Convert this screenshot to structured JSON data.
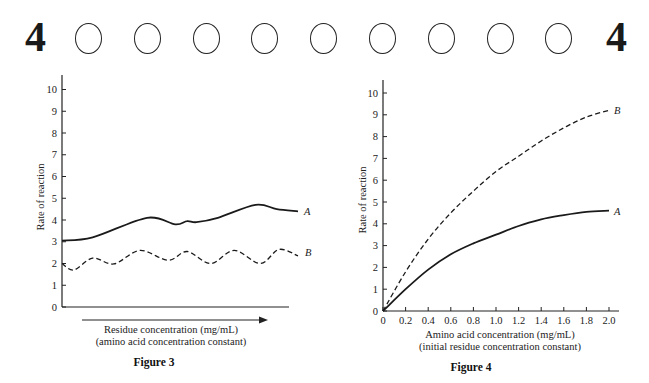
{
  "header": {
    "page_number_left": "4",
    "page_number_right": "4",
    "bubble_count": 9
  },
  "chart_data": [
    {
      "type": "line",
      "title": "Figure 3",
      "xlabel": "Residue concentration (mg/mL)",
      "xlabel_sub": "(amino acid concentration constant)",
      "ylabel": "Rate of reaction",
      "ylim": [
        0,
        10
      ],
      "yticks": [
        "0",
        "1",
        "2",
        "3",
        "4",
        "5",
        "6",
        "7",
        "8",
        "9",
        "10"
      ],
      "xticks": [],
      "x_axis_arrow": true,
      "grid": false,
      "series": [
        {
          "name": "A",
          "style": "solid",
          "x": [
            0,
            0.13,
            0.36,
            0.48,
            0.53,
            0.57,
            0.66,
            0.82,
            0.91,
            1.0
          ],
          "values": [
            3.05,
            3.2,
            4.1,
            3.8,
            3.95,
            3.9,
            4.1,
            4.7,
            4.5,
            4.4
          ]
        },
        {
          "name": "B",
          "style": "dashed",
          "x": [
            0,
            0.05,
            0.13,
            0.22,
            0.33,
            0.45,
            0.53,
            0.63,
            0.73,
            0.84,
            0.92,
            1.0
          ],
          "values": [
            2.0,
            1.7,
            2.25,
            1.98,
            2.6,
            2.15,
            2.55,
            2.0,
            2.6,
            2.0,
            2.65,
            2.35
          ]
        }
      ]
    },
    {
      "type": "line",
      "title": "Figure 4",
      "xlabel": "Amino acid concentration (mg/mL)",
      "xlabel_sub": "(initial residue concentration constant)",
      "ylabel": "Rate of reaction",
      "ylim": [
        0,
        10
      ],
      "xlim": [
        0,
        2.0
      ],
      "yticks": [
        "0",
        "1",
        "2",
        "3",
        "4",
        "5",
        "6",
        "7",
        "8",
        "9",
        "10"
      ],
      "xticks": [
        "0",
        "0.2",
        "0.4",
        "0.6",
        "0.8",
        "1.0",
        "1.2",
        "1.4",
        "1.6",
        "1.8",
        "2.0"
      ],
      "grid": false,
      "series": [
        {
          "name": "A",
          "style": "solid",
          "x": [
            0,
            0.2,
            0.4,
            0.6,
            0.8,
            1.0,
            1.2,
            1.4,
            1.6,
            1.8,
            2.0
          ],
          "values": [
            0,
            1.0,
            1.9,
            2.6,
            3.1,
            3.5,
            3.9,
            4.2,
            4.4,
            4.55,
            4.6
          ]
        },
        {
          "name": "B",
          "style": "dashed",
          "x": [
            0,
            0.2,
            0.4,
            0.6,
            0.8,
            1.0,
            1.2,
            1.4,
            1.6,
            1.8,
            2.0
          ],
          "values": [
            0,
            1.8,
            3.3,
            4.5,
            5.5,
            6.4,
            7.1,
            7.8,
            8.4,
            8.9,
            9.2
          ]
        }
      ]
    }
  ]
}
